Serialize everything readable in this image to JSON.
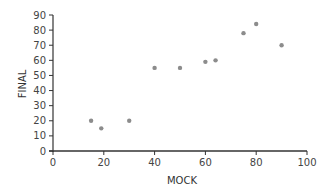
{
  "chart_data": {
    "type": "scatter",
    "title": "",
    "xlabel": "MOCK",
    "ylabel": "FINAL",
    "xlim": [
      0,
      100
    ],
    "ylim": [
      0,
      90
    ],
    "xticks": [
      0,
      20,
      40,
      60,
      80,
      100
    ],
    "yticks": [
      0,
      10,
      20,
      30,
      40,
      50,
      60,
      70,
      80,
      90
    ],
    "grid": false,
    "legend": null,
    "series": [
      {
        "name": "FINAL vs MOCK",
        "color": "#8c8c8c",
        "points": [
          {
            "x": 15,
            "y": 20
          },
          {
            "x": 19,
            "y": 15
          },
          {
            "x": 30,
            "y": 20
          },
          {
            "x": 40,
            "y": 55
          },
          {
            "x": 50,
            "y": 55
          },
          {
            "x": 60,
            "y": 59
          },
          {
            "x": 64,
            "y": 60
          },
          {
            "x": 75,
            "y": 78
          },
          {
            "x": 80,
            "y": 84
          },
          {
            "x": 90,
            "y": 70
          }
        ]
      }
    ]
  },
  "colors": {
    "axis": "#333333",
    "point": "#8c8c8c",
    "text": "#444444"
  }
}
